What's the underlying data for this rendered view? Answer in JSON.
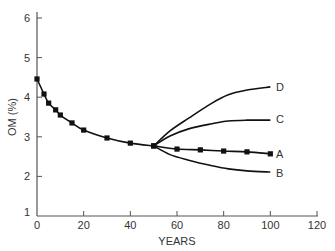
{
  "chart_data": {
    "type": "line",
    "title": "",
    "xlabel": "YEARS",
    "ylabel": "OM (%)",
    "xlim": [
      0,
      120
    ],
    "ylim": [
      1,
      6
    ],
    "xticks": [
      0,
      20,
      40,
      60,
      80,
      100,
      120
    ],
    "yticks": [
      1,
      2,
      3,
      4,
      5,
      6
    ],
    "grid": false,
    "legend_position": "inline labels at line ends",
    "series": [
      {
        "name": "History",
        "markers": true,
        "x": [
          0,
          3,
          5,
          8,
          10,
          15,
          20,
          30,
          40,
          50
        ],
        "y": [
          4.46,
          4.08,
          3.85,
          3.68,
          3.55,
          3.35,
          3.17,
          2.97,
          2.84,
          2.77
        ]
      },
      {
        "name": "A",
        "markers": true,
        "x": [
          50,
          60,
          70,
          80,
          90,
          100
        ],
        "y": [
          2.77,
          2.69,
          2.67,
          2.64,
          2.62,
          2.57
        ]
      },
      {
        "name": "B",
        "markers": false,
        "x": [
          50,
          57,
          65,
          75,
          82,
          90,
          100
        ],
        "y": [
          2.77,
          2.55,
          2.41,
          2.27,
          2.19,
          2.14,
          2.11
        ]
      },
      {
        "name": "C",
        "markers": false,
        "x": [
          50,
          57,
          65,
          75,
          82,
          90,
          100
        ],
        "y": [
          2.77,
          3.02,
          3.2,
          3.33,
          3.4,
          3.42,
          3.42
        ]
      },
      {
        "name": "D",
        "markers": false,
        "x": [
          50,
          57,
          65,
          75,
          82,
          90,
          100
        ],
        "y": [
          2.77,
          3.15,
          3.47,
          3.85,
          4.06,
          4.18,
          4.26
        ]
      }
    ]
  },
  "labels": {
    "xlabel": "YEARS",
    "ylabel": "OM (%)",
    "series_A": "A",
    "series_B": "B",
    "series_C": "C",
    "series_D": "D",
    "xticks": [
      "0",
      "20",
      "40",
      "60",
      "80",
      "100",
      "120"
    ],
    "yticks": [
      "1",
      "2",
      "3",
      "4",
      "5",
      "6"
    ]
  }
}
